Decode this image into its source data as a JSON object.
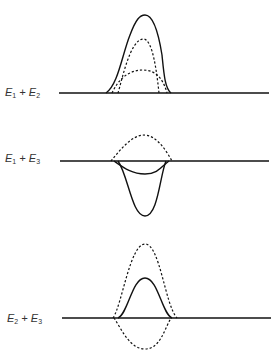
{
  "panels": [
    {
      "id": "e1-plus-e2",
      "label": {
        "a": "E",
        "a_sub": "1",
        "plus": " + ",
        "b": "E",
        "b_sub": "2"
      },
      "description": "Constructive superposition: two dashed pulses above baseline sum to a taller solid pulse"
    },
    {
      "id": "e1-plus-e3",
      "label": {
        "a": "E",
        "a_sub": "1",
        "plus": " + ",
        "b": "E",
        "b_sub": "3"
      },
      "description": "Dashed pulse above baseline, two solid pulses below baseline"
    },
    {
      "id": "e2-plus-e3",
      "label": {
        "a": "E",
        "a_sub": "2",
        "plus": " + ",
        "b": "E",
        "b_sub": "3"
      },
      "description": "Dashed pulses above and below baseline; solid resultant pulse above baseline"
    }
  ],
  "style": {
    "line_color": "#111111",
    "label_color": "#333333"
  }
}
